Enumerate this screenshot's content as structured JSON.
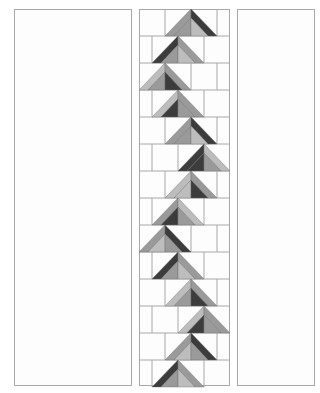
{
  "diagram": {
    "title": "",
    "type": "flying-geese-quilt-column",
    "palette": {
      "background": "#fdfdfd",
      "border": "#a8a8a8",
      "light": "#bdbdbd",
      "mid": "#9a9a9a",
      "dark": "#3c3c3c",
      "pale": "#f2f2f2"
    },
    "panels": {
      "left": {
        "x": 14,
        "y": 9,
        "w": 118,
        "h": 377
      },
      "center": {
        "x": 139,
        "y": 9,
        "w": 91,
        "h": 377
      },
      "right": {
        "x": 237,
        "y": 9,
        "w": 78,
        "h": 377
      }
    },
    "unit": {
      "width": 52,
      "height": 27,
      "band": 9
    },
    "rows": [
      {
        "y": 9,
        "apex": 191,
        "outerL": "mid",
        "outerR": "dark",
        "innerL": "mid",
        "innerR": "light"
      },
      {
        "y": 36,
        "apex": 178,
        "outerL": "dark",
        "outerR": "mid",
        "innerL": "mid",
        "innerR": "light"
      },
      {
        "y": 63,
        "apex": 165,
        "outerL": "light",
        "outerR": "mid",
        "innerL": "mid",
        "innerR": "dark"
      },
      {
        "y": 90,
        "apex": 178,
        "outerL": "light",
        "outerR": "mid",
        "innerL": "dark",
        "innerR": "mid"
      },
      {
        "y": 117,
        "apex": 191,
        "outerL": "mid",
        "outerR": "dark",
        "innerL": "mid",
        "innerR": "light"
      },
      {
        "y": 144,
        "apex": 204,
        "outerL": "dark",
        "outerR": "light",
        "innerL": "dark",
        "innerR": "mid"
      },
      {
        "y": 171,
        "apex": 191,
        "outerL": "light",
        "outerR": "mid",
        "innerL": "light",
        "innerR": "dark"
      },
      {
        "y": 198,
        "apex": 178,
        "outerL": "mid",
        "outerR": "light",
        "innerL": "dark",
        "innerR": "mid"
      },
      {
        "y": 225,
        "apex": 165,
        "outerL": "mid",
        "outerR": "dark",
        "innerL": "light",
        "innerR": "mid"
      },
      {
        "y": 252,
        "apex": 178,
        "outerL": "dark",
        "outerR": "mid",
        "innerL": "mid",
        "innerR": "light"
      },
      {
        "y": 279,
        "apex": 191,
        "outerL": "light",
        "outerR": "mid",
        "innerL": "mid",
        "innerR": "dark"
      },
      {
        "y": 306,
        "apex": 204,
        "outerL": "light",
        "outerR": "mid",
        "innerL": "dark",
        "innerR": "mid"
      },
      {
        "y": 333,
        "apex": 191,
        "outerL": "mid",
        "outerR": "dark",
        "innerL": "light",
        "innerR": "mid"
      },
      {
        "y": 360,
        "apex": 178,
        "outerL": "dark",
        "outerR": "mid",
        "innerL": "mid",
        "innerR": "light"
      }
    ]
  }
}
